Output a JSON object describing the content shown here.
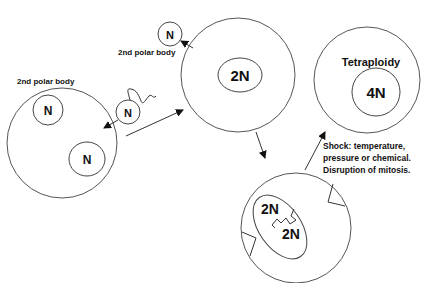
{
  "diagram": {
    "labels": {
      "polar_body_top": "2nd polar body",
      "polar_body_left": "2nd polar body",
      "tetraploidy": "Tetraploidy",
      "shock_line1": "Shock: temperature,",
      "shock_line2": "pressure or chemical.",
      "shock_line3": "Disruption of mitosis."
    },
    "nuclei": {
      "polar_top": "N",
      "left_polar": "N",
      "left_egg": "N",
      "sperm": "N",
      "zygote": "2N",
      "tetraploid": "4N",
      "mitosis_a": "2N",
      "mitosis_b": "2N"
    },
    "colors": {
      "stroke": "#555555",
      "text": "#111111",
      "background": "#ffffff"
    }
  }
}
